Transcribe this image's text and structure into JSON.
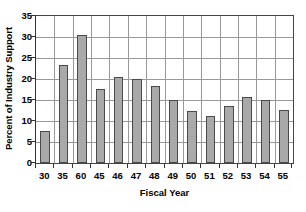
{
  "chart_data": {
    "type": "bar",
    "title": "",
    "subtitle": "",
    "xlabel": "Fiscal Year",
    "ylabel": "Percent of Industry Support",
    "categories": [
      "30",
      "35",
      "60",
      "45",
      "46",
      "47",
      "48",
      "49",
      "50",
      "51",
      "52",
      "53",
      "54",
      "55"
    ],
    "values": [
      7.7,
      23.3,
      30.4,
      17.7,
      20.6,
      20.0,
      18.3,
      15.1,
      12.4,
      11.3,
      13.6,
      15.7,
      15.0,
      12.6
    ],
    "ylim": [
      0,
      35
    ],
    "yticks": [
      0,
      5,
      10,
      15,
      20,
      25,
      30,
      35
    ],
    "ytick_labels": [
      "0",
      "5",
      "10",
      "15",
      "20",
      "25",
      "30",
      "35"
    ],
    "grid": true,
    "grid_axis": "both",
    "legend": false,
    "legend_position": "none",
    "bar_color": "#a9a9a9",
    "bar_border_color": "#4a4a4a",
    "gridline_color": "#999999",
    "axis_color": "#333333",
    "background_color": "#ffffff",
    "annotations": []
  }
}
